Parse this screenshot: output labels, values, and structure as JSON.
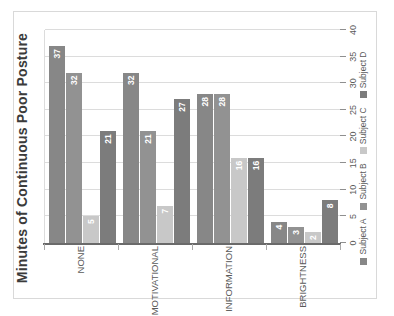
{
  "chart_data": {
    "type": "bar",
    "orientation": "horizontal",
    "rotation_note": "entire chart is displayed rotated 90 degrees counter-clockwise in the screenshot",
    "title": "Minutes of Continuous Poor Posture",
    "categories": [
      "NONE",
      "MOTIVATIONAL",
      "INFORMATION",
      "BRIGHTNESS"
    ],
    "series": [
      {
        "name": "Subject A",
        "color": "#878787",
        "values": [
          37,
          32,
          28,
          4
        ]
      },
      {
        "name": "Subject B",
        "color": "#929292",
        "values": [
          32,
          21,
          28,
          3
        ]
      },
      {
        "name": "Subject C",
        "color": "#c8c8c8",
        "values": [
          5,
          7,
          16,
          2
        ]
      },
      {
        "name": "Subject D",
        "color": "#7c7c7c",
        "values": [
          21,
          27,
          16,
          8
        ]
      }
    ],
    "value_axis": {
      "min": 0,
      "max": 40,
      "step": 5,
      "ticks": [
        "0",
        "5",
        "10",
        "15",
        "20",
        "25",
        "30",
        "35",
        "40"
      ]
    },
    "gridlines": true,
    "data_labels": "inside end, white",
    "legend_position": "bottom",
    "legend_marker": "square",
    "colors": {
      "background": "#ffffff",
      "chart_border": "#d9d9d9",
      "gridline": "#dcdcdc",
      "category_axis": "#6a6a6a",
      "tick_mark": "#8f8f8f",
      "title_text": "#3b3b3b",
      "axis_text": "#595959",
      "value_label_text": "#ffffff"
    }
  }
}
